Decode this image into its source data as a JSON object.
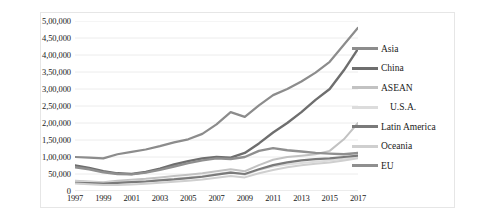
{
  "chart_data": {
    "type": "line",
    "title": "",
    "xlabel": "",
    "ylabel": "",
    "x": [
      1997,
      1998,
      1999,
      2000,
      2001,
      2002,
      2003,
      2004,
      2005,
      2006,
      2007,
      2008,
      2009,
      2010,
      2011,
      2012,
      2013,
      2014,
      2015,
      2016,
      2017
    ],
    "tick_labels_x": [
      "1997",
      "1999",
      "2001",
      "2003",
      "2005",
      "2007",
      "2009",
      "2011",
      "2013",
      "2015",
      "2017"
    ],
    "tick_labels_y": [
      "0",
      "50,000",
      "1,00,000",
      "1,50,000",
      "2,00,000",
      "2,50,000",
      "3,00,000",
      "3,50,000",
      "4,00,000",
      "4,50,000",
      "5,00,000"
    ],
    "ylim": [
      0,
      500000
    ],
    "ytick_step": 50000,
    "grid": "horizontal",
    "legend_position": "right",
    "series": [
      {
        "name": "Asia",
        "color": "#8c8c8c",
        "width": 2.2,
        "values": [
          100000,
          98000,
          96000,
          108000,
          115000,
          122000,
          132000,
          143000,
          152000,
          168000,
          196000,
          232000,
          218000,
          252000,
          282000,
          300000,
          322000,
          348000,
          380000,
          430000,
          480000
        ]
      },
      {
        "name": "China",
        "color": "#6e6e6e",
        "width": 2.4,
        "values": [
          75000,
          68000,
          58000,
          52000,
          50000,
          56000,
          66000,
          78000,
          88000,
          96000,
          100000,
          98000,
          112000,
          140000,
          172000,
          200000,
          232000,
          268000,
          300000,
          355000,
          418000
        ]
      },
      {
        "name": "ASEAN",
        "color": "#c2c2c2",
        "width": 2.0,
        "values": [
          30000,
          28000,
          26000,
          30000,
          33000,
          36000,
          40000,
          44000,
          48000,
          52000,
          58000,
          64000,
          58000,
          76000,
          92000,
          100000,
          104000,
          108000,
          118000,
          152000,
          200000
        ]
      },
      {
        "name": "U.S.A.",
        "color": "#dcdcdc",
        "width": 2.0,
        "values": [
          28000,
          26000,
          24000,
          26000,
          28000,
          30000,
          33000,
          36000,
          40000,
          44000,
          50000,
          56000,
          48000,
          62000,
          72000,
          78000,
          82000,
          86000,
          90000,
          95000,
          100000
        ]
      },
      {
        "name": "Latin America",
        "color": "#7a7a7a",
        "width": 2.2,
        "values": [
          24000,
          23000,
          22000,
          24000,
          26000,
          28000,
          31000,
          34000,
          38000,
          42000,
          48000,
          54000,
          50000,
          64000,
          76000,
          84000,
          90000,
          94000,
          96000,
          100000,
          104000
        ]
      },
      {
        "name": "Oceania",
        "color": "#cfcfcf",
        "width": 2.0,
        "values": [
          22000,
          20000,
          18000,
          18000,
          19000,
          21000,
          24000,
          27000,
          30000,
          34000,
          39000,
          44000,
          40000,
          52000,
          62000,
          70000,
          76000,
          80000,
          84000,
          90000,
          96000
        ]
      },
      {
        "name": "EU",
        "color": "#8f8f8f",
        "width": 2.4,
        "values": [
          70000,
          64000,
          55000,
          50000,
          49000,
          54000,
          62000,
          72000,
          82000,
          90000,
          96000,
          94000,
          100000,
          118000,
          126000,
          120000,
          116000,
          112000,
          110000,
          108000,
          112000
        ]
      }
    ]
  }
}
